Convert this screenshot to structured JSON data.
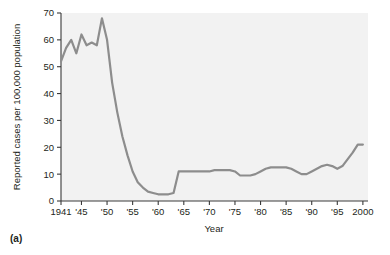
{
  "figure": {
    "panel_label": "(a)",
    "plot_bg_color": "#f2f2f2",
    "line_color": "#8d8d8d",
    "axis_color": "#3a3a3a"
  },
  "chart_data": {
    "type": "line",
    "title": "",
    "xlabel": "Year",
    "ylabel": "Reported cases per 100,000 population",
    "xlim": [
      1941,
      2001
    ],
    "ylim": [
      0,
      70
    ],
    "grid": false,
    "legend": null,
    "x_tick_labels": [
      "1941",
      "'45",
      "'50",
      "'55",
      "'60",
      "'65",
      "'70",
      "'75",
      "'80",
      "'85",
      "'90",
      "'95",
      "2000"
    ],
    "x_tick_values": [
      1941,
      1945,
      1950,
      1955,
      1960,
      1965,
      1970,
      1975,
      1980,
      1985,
      1990,
      1995,
      2000
    ],
    "y_tick_labels": [
      "0",
      "10",
      "20",
      "30",
      "40",
      "50",
      "60",
      "70"
    ],
    "y_tick_values": [
      0,
      10,
      20,
      30,
      40,
      50,
      60,
      70
    ],
    "series": [
      {
        "name": "Reported cases per 100,000 population",
        "x": [
          1941,
          1942,
          1943,
          1944,
          1945,
          1946,
          1947,
          1948,
          1949,
          1950,
          1951,
          1952,
          1953,
          1954,
          1955,
          1956,
          1957,
          1958,
          1959,
          1960,
          1961,
          1962,
          1963,
          1964,
          1965,
          1966,
          1967,
          1968,
          1969,
          1970,
          1971,
          1972,
          1973,
          1974,
          1975,
          1976,
          1977,
          1978,
          1979,
          1980,
          1981,
          1982,
          1983,
          1984,
          1985,
          1986,
          1987,
          1988,
          1989,
          1990,
          1991,
          1992,
          1993,
          1994,
          1995,
          1996,
          1997,
          1998,
          1999,
          2000
        ],
        "y": [
          52,
          57,
          60,
          55,
          62,
          58,
          59,
          58,
          68,
          60,
          44,
          33,
          24,
          17,
          11,
          7,
          5,
          3.5,
          3,
          2.5,
          2.5,
          2.5,
          3,
          11,
          11,
          11,
          11,
          11,
          11,
          11,
          11.5,
          11.5,
          11.5,
          11.5,
          11,
          9.5,
          9.5,
          9.5,
          10,
          11,
          12,
          12.5,
          12.5,
          12.5,
          12.5,
          12,
          11,
          10,
          10,
          11,
          12,
          13,
          13.5,
          13,
          12,
          13,
          15.5,
          18,
          21,
          21
        ]
      }
    ],
    "annotations": []
  }
}
